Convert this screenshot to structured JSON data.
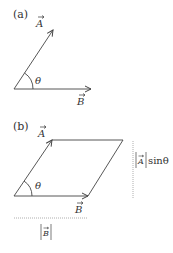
{
  "panel_a": {
    "label": "(a)",
    "vector_a_label": "A",
    "vector_b_label": "B",
    "angle_label": "θ"
  },
  "panel_b": {
    "label": "(b)",
    "vector_a_label": "A",
    "vector_b_label": "B",
    "angle_label": "θ",
    "height_label_vector": "A",
    "height_label_suffix": "sinθ",
    "base_label_vector": "B"
  },
  "colors": {
    "stroke": "#444444",
    "dotted": "#999999"
  }
}
